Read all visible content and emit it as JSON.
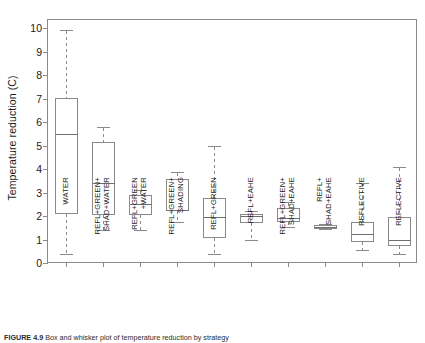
{
  "figure": {
    "caption_label": "FIGURE 4.9",
    "caption_text": "Box and whisker plot of temperature reduction by strategy"
  },
  "axes": {
    "y_title": "Temperature reduction (C)",
    "y_ticks": [
      0,
      1,
      2,
      3,
      4,
      5,
      6,
      7,
      8,
      9,
      10
    ],
    "x_title": ""
  },
  "chart_data": {
    "type": "box",
    "title": "",
    "xlabel": "",
    "ylabel": "Temperature reduction (C)",
    "ylim": [
      0,
      10.4
    ],
    "grid": false,
    "legend": "none",
    "categories": [
      "WATER",
      "REFL+GREEN+\nSHAD+WATER",
      "REFL+GREEN\n+WATER",
      "REFL+GREEN+\nSHADING",
      "REFL+GREEN",
      "REFL+EAHE",
      "REFL+GREEN+\nSHAD+EAHE",
      "REFL+\nSHAD+EAHE",
      "REFLECTIVE",
      "REFLECTIVE"
    ],
    "boxes": [
      {
        "label": "WATER",
        "whisker_low": 0.4,
        "q1": 2.15,
        "median": 5.5,
        "q3": 7.05,
        "whisker_high": 9.95
      },
      {
        "label": "REFL+GREEN+SHAD+WATER",
        "whisker_low": 1.4,
        "q1": 2.1,
        "median": 3.4,
        "q3": 5.15,
        "whisker_high": 5.8
      },
      {
        "label": "REFL+GREEN+WATER",
        "whisker_low": 1.4,
        "q1": 2.1,
        "median": 2.5,
        "q3": 2.9,
        "whisker_high": 3.1
      },
      {
        "label": "REFL+GREEN+SHADING",
        "whisker_low": 1.75,
        "q1": 2.25,
        "median": 2.25,
        "q3": 3.6,
        "whisker_high": 3.9
      },
      {
        "label": "REFL+GREEN",
        "whisker_low": 0.4,
        "q1": 1.1,
        "median": 1.95,
        "q3": 2.75,
        "whisker_high": 5.0
      },
      {
        "label": "REFL+EAHE",
        "whisker_low": 1.0,
        "q1": 1.75,
        "median": 2.0,
        "q3": 2.1,
        "whisker_high": 2.2
      },
      {
        "label": "REFL+GREEN+SHAD+EAHE",
        "whisker_low": 1.55,
        "q1": 1.8,
        "median": 1.9,
        "q3": 2.35,
        "whisker_high": 2.6
      },
      {
        "label": "REFL+SHAD+EAHE",
        "whisker_low": 1.45,
        "q1": 1.5,
        "median": 1.55,
        "q3": 1.6,
        "whisker_high": 1.65
      },
      {
        "label": "REFLECTIVE",
        "whisker_low": 0.55,
        "q1": 0.95,
        "median": 1.25,
        "q3": 1.75,
        "whisker_high": 3.4
      },
      {
        "label": "REFLECTIVE",
        "whisker_low": 0.4,
        "q1": 0.75,
        "median": 1.0,
        "q3": 1.95,
        "whisker_high": 4.1
      }
    ]
  },
  "style": {
    "box_stroke": "#8a8a8a",
    "median_stroke": "#6e6e6e",
    "whisker_stroke": "#8a8a8a",
    "axis_color": "#8a8a8a",
    "text_color": "#1a1a1a",
    "background": "#ffffff"
  }
}
